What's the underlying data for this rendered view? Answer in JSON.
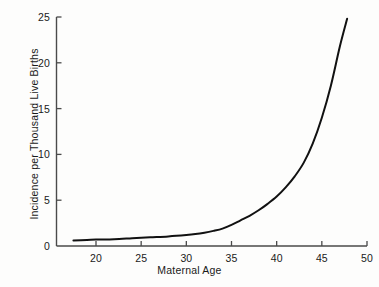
{
  "chart_data": {
    "type": "line",
    "title": "",
    "subtitle": "",
    "xlabel": "Maternal Age",
    "ylabel": "Incidence per Thousand Live Births",
    "xlim": [
      17,
      50
    ],
    "ylim": [
      0,
      25
    ],
    "xticks": [
      20,
      25,
      30,
      35,
      40,
      45,
      50
    ],
    "xtick_labels": [
      "20",
      "25",
      "30",
      "35",
      "40",
      "45",
      "50"
    ],
    "yticks": [
      0,
      5,
      10,
      15,
      20,
      25
    ],
    "ytick_labels": [
      "0",
      "5",
      "10",
      "15",
      "20",
      "25"
    ],
    "grid": false,
    "legend": null,
    "annotations": [],
    "line_color": "#111111",
    "line_width": 2.0,
    "axis_color": "#555555",
    "background_color": "#fdfdfc",
    "series": [
      {
        "name": "Incidence",
        "x": [
          17.5,
          19,
          20,
          22,
          24,
          26,
          28,
          30,
          31,
          32,
          33,
          34,
          35,
          36,
          37,
          38,
          39,
          40,
          41,
          42,
          43,
          44,
          45,
          46,
          47,
          47.8
        ],
        "values": [
          0.6,
          0.65,
          0.7,
          0.75,
          0.85,
          0.95,
          1.05,
          1.2,
          1.3,
          1.45,
          1.65,
          1.9,
          2.3,
          2.8,
          3.3,
          3.9,
          4.6,
          5.4,
          6.4,
          7.6,
          9.1,
          11.2,
          14.0,
          17.5,
          21.8,
          24.8
        ]
      }
    ]
  },
  "axes": {
    "x_axis_name": "maternal-age-axis",
    "y_axis_name": "incidence-axis"
  }
}
